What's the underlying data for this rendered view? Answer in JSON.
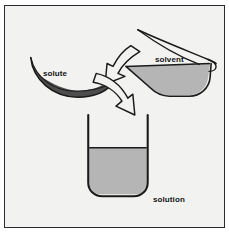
{
  "figure": {
    "top_caption": "",
    "frame": {
      "border_color": "#2b2b2b",
      "background_color": "#f2f2f0"
    },
    "colors": {
      "outline": "#1a1a1a",
      "solute_fill": "#565656",
      "solvent_fill": "#b5b5b5",
      "solution_fill": "#b5b5b5",
      "arrow_fill": "#f2f2f0",
      "page_background": "#ffffff",
      "label_text": "#141414"
    },
    "labels": {
      "solute": "solute",
      "solvent": "solvent",
      "solution": "solution"
    },
    "elements": {
      "solute_dish": {
        "name": "watch-glass-dish",
        "contains": "solute",
        "fill": "#565656"
      },
      "solvent_container": {
        "name": "tilted-beaker",
        "contains": "solvent",
        "fill": "#b5b5b5",
        "state": "pouring"
      },
      "solution_beaker": {
        "name": "beaker",
        "contains": "solution",
        "fill": "#b5b5b5",
        "fill_level_percent": 63
      },
      "arrows": [
        {
          "name": "solvent-transfer-arrow",
          "from": "solvent",
          "to": "solution"
        },
        {
          "name": "solute-transfer-arrow",
          "from": "solute",
          "to": "solution"
        }
      ]
    }
  }
}
